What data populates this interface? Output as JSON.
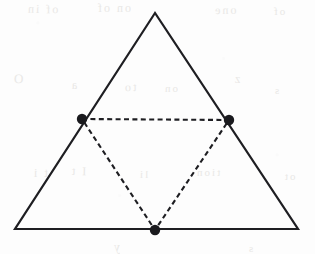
{
  "figure": {
    "background_color": "#fdfdfd",
    "stroke_color": "#1e1e22",
    "ghost_color": "#e9e8e6",
    "canvas": {
      "width": 315,
      "height": 254
    },
    "outer_triangle": {
      "name": "outer-triangle",
      "style": "solid",
      "stroke_width": 2.2,
      "vertices": [
        {
          "name": "apex",
          "x": 155,
          "y": 13
        },
        {
          "name": "bottom-left",
          "x": 15,
          "y": 229
        },
        {
          "name": "bottom-right",
          "x": 298,
          "y": 229
        }
      ],
      "points": "155,13 15,229 298,229"
    },
    "medial_triangle": {
      "name": "medial-triangle",
      "style": "dashed",
      "stroke_width": 2.1,
      "dash_pattern": "5,3.4",
      "vertices": [
        {
          "name": "midpoint-left",
          "x": 82,
          "y": 119
        },
        {
          "name": "midpoint-right",
          "x": 229,
          "y": 120
        },
        {
          "name": "midpoint-bottom",
          "x": 155,
          "y": 230
        }
      ],
      "points": "82,119 229,120 155,230"
    },
    "midpoint_dots": [
      {
        "name": "dot-midpoint-left",
        "x": 82,
        "y": 119,
        "radius": 5.2,
        "fill": "#1a1a1e"
      },
      {
        "name": "dot-midpoint-right",
        "x": 229,
        "y": 120,
        "radius": 5.2,
        "fill": "#1a1a1e"
      },
      {
        "name": "dot-midpoint-bottom",
        "x": 155,
        "y": 230,
        "radius": 5.2,
        "fill": "#1a1a1e"
      }
    ],
    "ghost_marks": [
      {
        "name": "ghost-line-1",
        "text": "of in",
        "x": 26,
        "y": 2,
        "size": 12,
        "rotate": -1
      },
      {
        "name": "ghost-line-2",
        "text": "on of",
        "x": 96,
        "y": 1,
        "size": 12,
        "rotate": 0
      },
      {
        "name": "ghost-line-3",
        "text": "one",
        "x": 213,
        "y": 3,
        "size": 12,
        "rotate": 1
      },
      {
        "name": "ghost-line-4",
        "text": "of",
        "x": 272,
        "y": 5,
        "size": 11,
        "rotate": 0
      },
      {
        "name": "ghost-line-5",
        "text": "O",
        "x": 12,
        "y": 71,
        "size": 13,
        "rotate": -2
      },
      {
        "name": "ghost-line-6",
        "text": "a",
        "x": 70,
        "y": 78,
        "size": 12,
        "rotate": 0
      },
      {
        "name": "ghost-line-7",
        "text": "to",
        "x": 123,
        "y": 80,
        "size": 12,
        "rotate": 1
      },
      {
        "name": "ghost-line-8",
        "text": "on",
        "x": 163,
        "y": 82,
        "size": 11,
        "rotate": 0
      },
      {
        "name": "ghost-line-9",
        "text": "z",
        "x": 233,
        "y": 72,
        "size": 12,
        "rotate": 0
      },
      {
        "name": "ghost-line-10",
        "text": "s",
        "x": 273,
        "y": 84,
        "size": 11,
        "rotate": 0
      },
      {
        "name": "ghost-line-11",
        "text": "t i",
        "x": 32,
        "y": 166,
        "size": 12,
        "rotate": 0
      },
      {
        "name": "ghost-line-12",
        "text": "I t",
        "x": 70,
        "y": 164,
        "size": 12,
        "rotate": -1
      },
      {
        "name": "ghost-line-13",
        "text": "li",
        "x": 138,
        "y": 168,
        "size": 11,
        "rotate": 0
      },
      {
        "name": "ghost-line-14",
        "text": "tion",
        "x": 195,
        "y": 166,
        "size": 11,
        "rotate": 0
      },
      {
        "name": "ghost-line-15",
        "text": "ot",
        "x": 283,
        "y": 170,
        "size": 11,
        "rotate": 0
      },
      {
        "name": "ghost-line-16",
        "text": "y",
        "x": 112,
        "y": 240,
        "size": 12,
        "rotate": 0
      },
      {
        "name": "ghost-line-17",
        "text": "s",
        "x": 247,
        "y": 242,
        "size": 11,
        "rotate": 0
      }
    ]
  }
}
